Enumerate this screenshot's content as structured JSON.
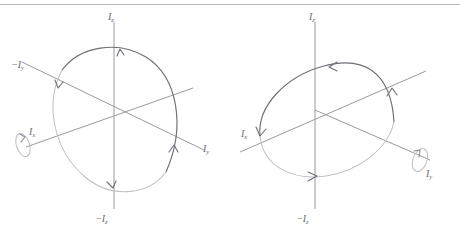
{
  "figure": {
    "background_color": "#ffffff",
    "rule_color": "#b9b9bd",
    "axis_color": "#9a9aa0",
    "orbit_dark_color": "#6e6e76",
    "orbit_light_color": "#c0c0c6",
    "label_color": "#6b6b73",
    "panel_count": 2
  },
  "panels": [
    {
      "id": "left-panel",
      "name": "rotation-about-Ix",
      "rotation_axis_label": "Ix",
      "axes": [
        {
          "name": "z-positive",
          "label_prefix": "",
          "label_base": "I",
          "label_sub": "z",
          "label": "Iz"
        },
        {
          "name": "z-negative",
          "label_prefix": "−",
          "label_base": "I",
          "label_sub": "z",
          "label": "−Iz"
        },
        {
          "name": "y-positive",
          "label_prefix": "",
          "label_base": "I",
          "label_sub": "y",
          "label": "Iy"
        },
        {
          "name": "y-negative",
          "label_prefix": "−",
          "label_base": "I",
          "label_sub": "y",
          "label": "−Iy"
        },
        {
          "name": "x-positive",
          "label_prefix": "",
          "label_base": "I",
          "label_sub": "x",
          "label": "Ix"
        }
      ],
      "labels": {
        "z_top": {
          "prefix": "",
          "base": "I",
          "sub": "z"
        },
        "z_bottom": {
          "prefix": "−",
          "base": "I",
          "sub": "z"
        },
        "y_right": {
          "prefix": "",
          "base": "I",
          "sub": "y"
        },
        "y_left": {
          "prefix": "−",
          "base": "I",
          "sub": "y"
        },
        "x_end": {
          "prefix": "",
          "base": "I",
          "sub": "x"
        }
      },
      "orbit": {
        "description": "trajectory in the z-y plane, viewed obliquely; steeply tilted ellipse",
        "direction": "arrowheads on +Iz, −Iy, −Iz and +Iy crossings",
        "arrow_count": 4
      }
    },
    {
      "id": "right-panel",
      "name": "rotation-about-Iy",
      "rotation_axis_label": "Iy",
      "axes": [
        {
          "name": "z-positive",
          "label_prefix": "",
          "label_base": "I",
          "label_sub": "z",
          "label": "Iz"
        },
        {
          "name": "z-negative",
          "label_prefix": "−",
          "label_base": "I",
          "label_sub": "z",
          "label": "−Iz"
        },
        {
          "name": "x-left",
          "label_prefix": "",
          "label_base": "I",
          "label_sub": "x",
          "label": "Ix"
        },
        {
          "name": "y-end",
          "label_prefix": "",
          "label_base": "I",
          "label_sub": "y",
          "label": "Iy"
        }
      ],
      "labels": {
        "z_top": {
          "prefix": "",
          "base": "I",
          "sub": "z"
        },
        "z_bottom": {
          "prefix": "−",
          "base": "I",
          "sub": "z"
        },
        "x_left": {
          "prefix": "",
          "base": "I",
          "sub": "x"
        },
        "y_end": {
          "prefix": "",
          "base": "I",
          "sub": "y"
        }
      },
      "orbit": {
        "description": "trajectory in the z-x plane, viewed obliquely; shallow wide ellipse",
        "direction": "arrowheads at top pointing left, at Ix pointing down, at bottom pointing right, at right pointing up",
        "arrow_count": 4
      }
    }
  ]
}
